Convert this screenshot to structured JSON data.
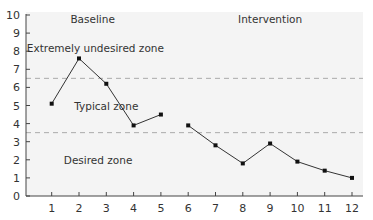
{
  "chart_data": {
    "type": "line",
    "title": "",
    "xlabel": "",
    "ylabel": "",
    "x": [
      1,
      2,
      3,
      4,
      5,
      6,
      7,
      8,
      9,
      10,
      11,
      12
    ],
    "xlim": [
      0,
      12.4
    ],
    "ylim": [
      0,
      10
    ],
    "yticks": [
      0,
      1,
      2,
      3,
      4,
      5,
      6,
      7,
      8,
      9,
      10
    ],
    "xticks": [
      1,
      2,
      3,
      4,
      5,
      6,
      7,
      8,
      9,
      10,
      11,
      12
    ],
    "grid": false,
    "series": [
      {
        "name": "Baseline",
        "x": [
          1,
          2,
          3,
          4,
          5
        ],
        "values": [
          5.1,
          7.6,
          6.2,
          3.9,
          4.5
        ]
      },
      {
        "name": "Intervention",
        "x": [
          6,
          7,
          8,
          9,
          10,
          11,
          12
        ],
        "values": [
          3.9,
          2.8,
          1.8,
          2.9,
          1.9,
          1.4,
          1.0
        ]
      }
    ],
    "reference_lines": [
      {
        "y": 6.5,
        "style": "dashed"
      },
      {
        "y": 3.5,
        "style": "dashed"
      }
    ],
    "annotations": [
      {
        "text": "Baseline",
        "x": 2.5,
        "y": 9.8
      },
      {
        "text": "Intervention",
        "x": 9,
        "y": 9.8
      },
      {
        "text": "Extremely undesired zone",
        "x": 2.6,
        "y": 8.2
      },
      {
        "text": "Typical zone",
        "x": 3,
        "y": 5.0
      },
      {
        "text": "Desired zone",
        "x": 2.7,
        "y": 2.0
      }
    ],
    "colors": {
      "line": "#333333",
      "marker": "#111111",
      "dash": "#aaaaaa",
      "plot_bg": "#f4f4f4"
    }
  }
}
